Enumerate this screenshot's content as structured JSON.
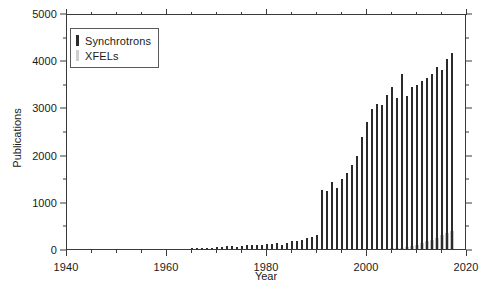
{
  "chart_data": {
    "type": "bar",
    "title": "",
    "xlabel": "Year",
    "ylabel": "Publications",
    "xlim": [
      1940,
      2020
    ],
    "ylim": [
      0,
      5000
    ],
    "grid": false,
    "legend_position": "upper left",
    "x_major_ticks": [
      1940,
      1960,
      1980,
      2000,
      2020
    ],
    "x_minor_tick_step": 5,
    "y_major_ticks": [
      0,
      1000,
      2000,
      3000,
      4000,
      5000
    ],
    "y_minor_tick_step": 500,
    "x": [
      1940,
      1941,
      1942,
      1943,
      1944,
      1945,
      1946,
      1947,
      1948,
      1949,
      1950,
      1951,
      1952,
      1953,
      1954,
      1955,
      1956,
      1957,
      1958,
      1959,
      1960,
      1961,
      1962,
      1963,
      1964,
      1965,
      1966,
      1967,
      1968,
      1969,
      1970,
      1971,
      1972,
      1973,
      1974,
      1975,
      1976,
      1977,
      1978,
      1979,
      1980,
      1981,
      1982,
      1983,
      1984,
      1985,
      1986,
      1987,
      1988,
      1989,
      1990,
      1991,
      1992,
      1993,
      1994,
      1995,
      1996,
      1997,
      1998,
      1999,
      2000,
      2001,
      2002,
      2003,
      2004,
      2005,
      2006,
      2007,
      2008,
      2009,
      2010,
      2011,
      2012,
      2013,
      2014,
      2015,
      2016,
      2017
    ],
    "series": [
      {
        "name": "Synchrotrons",
        "color": "#2b2b2b",
        "values": [
          0,
          0,
          0,
          0,
          0,
          0,
          0,
          0,
          0,
          0,
          0,
          0,
          0,
          0,
          0,
          0,
          0,
          0,
          0,
          0,
          0,
          0,
          0,
          0,
          0,
          10,
          15,
          20,
          25,
          30,
          35,
          45,
          55,
          60,
          50,
          70,
          90,
          75,
          95,
          85,
          110,
          100,
          130,
          95,
          120,
          160,
          175,
          190,
          230,
          255,
          300,
          1250,
          1230,
          1420,
          1300,
          1490,
          1620,
          1780,
          1980,
          2370,
          2700,
          2960,
          3080,
          3060,
          3260,
          3430,
          3200,
          3700,
          3250,
          3440,
          3480,
          3550,
          3620,
          3700,
          3850,
          3800,
          4020,
          4150
        ]
      },
      {
        "name": "XFELs",
        "color": "#c8c8c8",
        "values": [
          0,
          0,
          0,
          0,
          0,
          0,
          0,
          0,
          0,
          0,
          0,
          0,
          0,
          0,
          0,
          0,
          0,
          0,
          0,
          0,
          0,
          0,
          0,
          0,
          0,
          0,
          0,
          0,
          0,
          0,
          0,
          0,
          0,
          0,
          0,
          0,
          0,
          0,
          0,
          0,
          0,
          0,
          0,
          0,
          0,
          0,
          0,
          0,
          0,
          0,
          0,
          0,
          0,
          0,
          0,
          0,
          0,
          0,
          0,
          0,
          0,
          0,
          0,
          0,
          0,
          10,
          15,
          25,
          40,
          60,
          90,
          120,
          160,
          200,
          240,
          290,
          330,
          380
        ]
      }
    ]
  }
}
